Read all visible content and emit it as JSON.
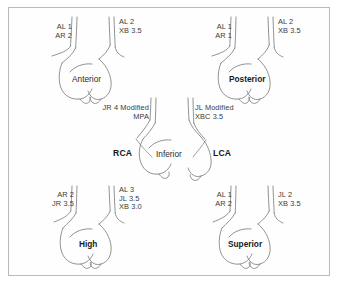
{
  "figure": {
    "background_color": "#ffffff",
    "border_color": "#b9b9b9",
    "ink_color": "#6b6b6b",
    "text_color": "#3a3a3a"
  },
  "panels": [
    {
      "id": "anterior",
      "view_name": "Anterior",
      "bold": false,
      "left_label": "AL 1\nAR 2",
      "right_label": "AL 2\nXB 3.5"
    },
    {
      "id": "posterior",
      "view_name": "Posterior",
      "bold": true,
      "left_label": "AL 1\nAR 1",
      "right_label": "AL 2\nXB 3.5"
    },
    {
      "id": "inferior",
      "view_name": "Inferior",
      "bold": false,
      "left_label": "JR 4 Modified\nMPA",
      "right_label": "JL Modified\nXBC 3.5",
      "left_vessel": "RCA",
      "right_vessel": "LCA"
    },
    {
      "id": "high",
      "view_name": "High",
      "bold": true,
      "left_label": "AR 2\nJR 3.5",
      "right_label": "AL 3\nJL 3.5\nXB 3.0"
    },
    {
      "id": "superior",
      "view_name": "Superior",
      "bold": true,
      "left_label": "AL 1\nAR 2",
      "right_label": "JL 2\nXB 3.5"
    }
  ]
}
